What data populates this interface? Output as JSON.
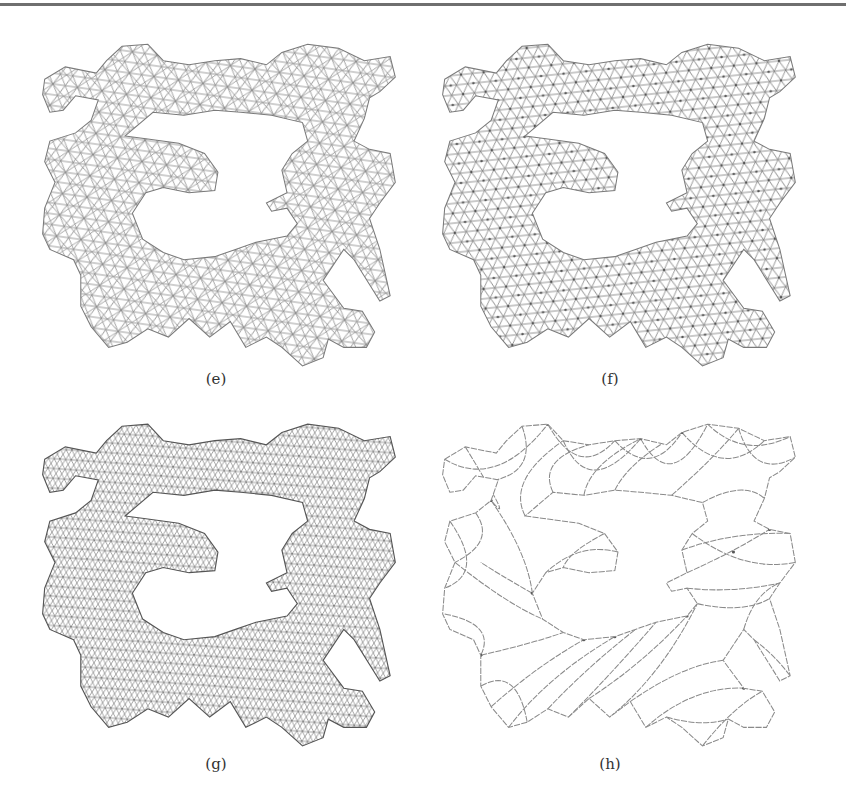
{
  "figure": {
    "panels": [
      {
        "id": "e",
        "caption": "(e)",
        "description": "medium-density triangular mesh of puzzle-like shape with central hole"
      },
      {
        "id": "f",
        "caption": "(f)",
        "description": "medium-density triangular mesh with visible vertices"
      },
      {
        "id": "g",
        "caption": "(g)",
        "description": "fine, dense triangular mesh"
      },
      {
        "id": "h",
        "caption": "(h)",
        "description": "coarse curved-edge triangular mesh"
      }
    ]
  },
  "colors": {
    "rule": "#6f6f6f",
    "mesh": "#8a8a8a",
    "caption": "#333333",
    "background": "#ffffff"
  }
}
